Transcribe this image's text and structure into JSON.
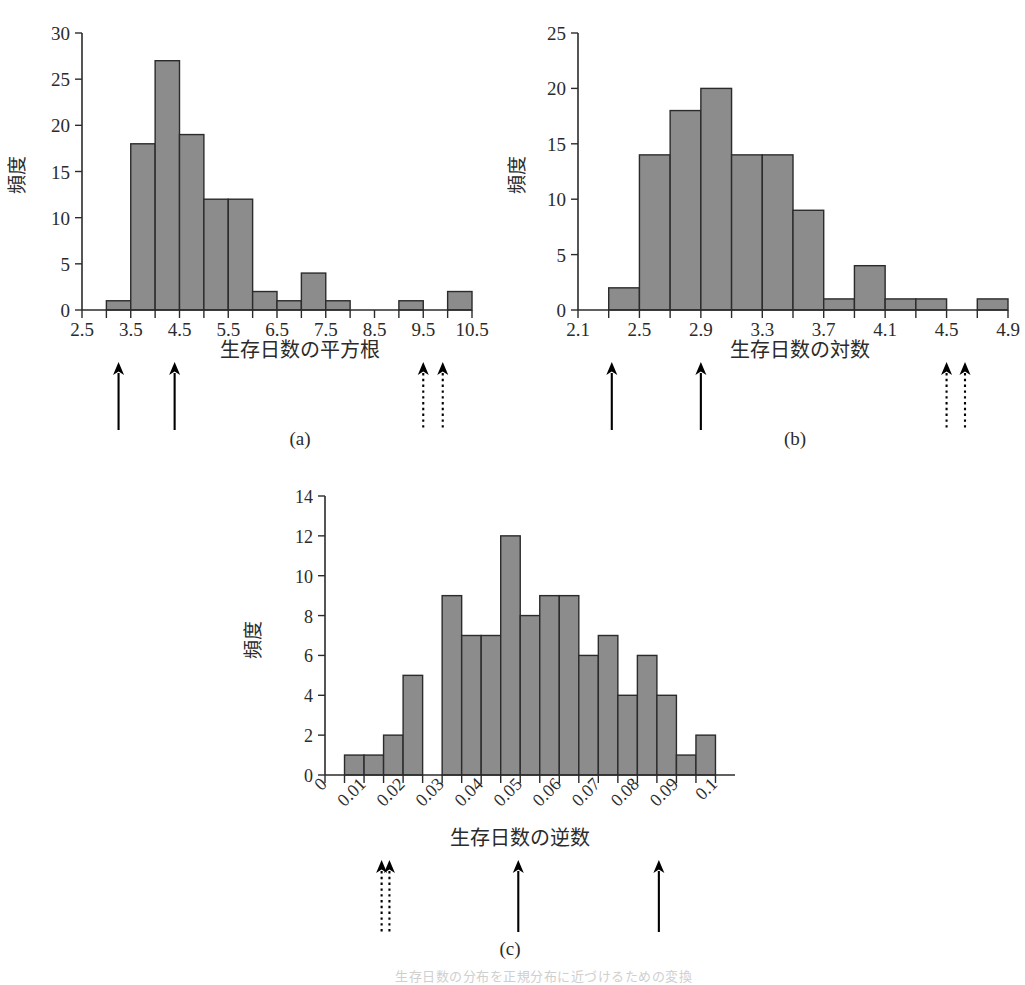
{
  "figure": {
    "panel_captions": [
      "(a)",
      "(b)",
      "(c)"
    ],
    "y_axis_label": "頻度",
    "bottom_note": "生存日数の分布を正規分布に近づけるための変換"
  },
  "chart_data": [
    {
      "type": "bar",
      "panel": "(a)",
      "title": "",
      "xlabel": "生存日数の平方根",
      "ylabel": "頻度",
      "xlim": [
        2.5,
        10.5
      ],
      "ylim": [
        0,
        30
      ],
      "ytick_labels": [
        "0",
        "5",
        "10",
        "15",
        "20",
        "25",
        "30"
      ],
      "ytick_values": [
        0,
        5,
        10,
        15,
        20,
        25,
        30
      ],
      "xtick_labels": [
        "2.5",
        "3.5",
        "4.5",
        "5.5",
        "6.5",
        "7.5",
        "8.5",
        "9.5",
        "10.5"
      ],
      "xtick_values": [
        2.5,
        3.5,
        4.5,
        5.5,
        6.5,
        7.5,
        8.5,
        9.5,
        10.5
      ],
      "bin_width": 0.5,
      "bin_starts": [
        3.0,
        3.5,
        4.0,
        4.5,
        5.0,
        5.5,
        6.0,
        6.5,
        7.0,
        7.5,
        9.0,
        9.5,
        10.0
      ],
      "values": [
        1,
        18,
        27,
        19,
        12,
        12,
        2,
        1,
        4,
        1,
        1,
        0,
        2
      ],
      "grid": false,
      "legend": "none",
      "annotations": [
        {
          "x": 3.25,
          "style": "solid",
          "name": "marker-arrow-1"
        },
        {
          "x": 4.4,
          "style": "solid",
          "name": "marker-arrow-2"
        },
        {
          "x": 9.5,
          "style": "dotted",
          "name": "marker-arrow-3"
        },
        {
          "x": 9.9,
          "style": "dotted",
          "name": "marker-arrow-4"
        }
      ]
    },
    {
      "type": "bar",
      "panel": "(b)",
      "title": "",
      "xlabel": "生存日数の対数",
      "ylabel": "頻度",
      "xlim": [
        2.1,
        4.9
      ],
      "ylim": [
        0,
        25
      ],
      "ytick_labels": [
        "0",
        "5",
        "10",
        "15",
        "20",
        "25"
      ],
      "ytick_values": [
        0,
        5,
        10,
        15,
        20,
        25
      ],
      "xtick_labels": [
        "2.1",
        "2.5",
        "2.9",
        "3.3",
        "3.7",
        "4.1",
        "4.5",
        "4.9"
      ],
      "xtick_values": [
        2.1,
        2.5,
        2.9,
        3.3,
        3.7,
        4.1,
        4.5,
        4.9
      ],
      "bin_width": 0.2,
      "bin_starts": [
        2.3,
        2.5,
        2.7,
        2.9,
        3.1,
        3.3,
        3.5,
        3.7,
        3.9,
        4.1,
        4.3,
        4.5,
        4.7
      ],
      "values": [
        2,
        14,
        18,
        20,
        14,
        14,
        9,
        1,
        4,
        1,
        1,
        0,
        1,
        1
      ],
      "grid": false,
      "legend": "none",
      "annotations": [
        {
          "x": 2.32,
          "style": "solid",
          "name": "marker-arrow-1"
        },
        {
          "x": 2.9,
          "style": "solid",
          "name": "marker-arrow-2"
        },
        {
          "x": 4.5,
          "style": "dotted",
          "name": "marker-arrow-3"
        },
        {
          "x": 4.62,
          "style": "dotted",
          "name": "marker-arrow-4"
        }
      ]
    },
    {
      "type": "bar",
      "panel": "(c)",
      "title": "",
      "xlabel": "生存日数の逆数",
      "ylabel": "頻度",
      "xlim": [
        0,
        0.105
      ],
      "ylim": [
        0,
        14
      ],
      "ytick_labels": [
        "0",
        "2",
        "4",
        "6",
        "8",
        "10",
        "12",
        "14"
      ],
      "ytick_values": [
        0,
        2,
        4,
        6,
        8,
        10,
        12,
        14
      ],
      "xtick_labels": [
        "0",
        "0.01",
        "0.02",
        "0.03",
        "0.04",
        "0.05",
        "0.06",
        "0.07",
        "0.08",
        "0.09",
        "0.1"
      ],
      "xtick_values": [
        0,
        0.01,
        0.02,
        0.03,
        0.04,
        0.05,
        0.06,
        0.07,
        0.08,
        0.09,
        0.1
      ],
      "bin_width": 0.005,
      "bin_starts": [
        0.005,
        0.01,
        0.015,
        0.02,
        0.03,
        0.035,
        0.04,
        0.045,
        0.05,
        0.055,
        0.06,
        0.065,
        0.07,
        0.075,
        0.08,
        0.085,
        0.09,
        0.095
      ],
      "values": [
        1,
        1,
        2,
        5,
        9,
        7,
        7,
        12,
        8,
        9,
        9,
        6,
        7,
        4,
        6,
        4,
        1,
        2
      ],
      "grid": false,
      "legend": "none",
      "annotations": [
        {
          "x": 0.0145,
          "style": "dotted",
          "name": "marker-arrow-1"
        },
        {
          "x": 0.0165,
          "style": "dotted",
          "name": "marker-arrow-2"
        },
        {
          "x": 0.0495,
          "style": "solid",
          "name": "marker-arrow-3"
        },
        {
          "x": 0.0855,
          "style": "solid",
          "name": "marker-arrow-4"
        }
      ]
    }
  ]
}
